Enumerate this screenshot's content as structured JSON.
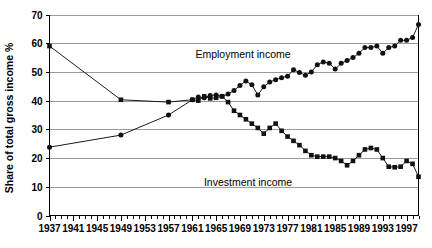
{
  "chart_data": {
    "type": "line",
    "title": "",
    "xlabel": "",
    "ylabel": "Share of total gross income %",
    "ylim": [
      0,
      70
    ],
    "ytick_step": 10,
    "yticks": [
      0,
      10,
      20,
      30,
      40,
      50,
      60,
      70
    ],
    "xlim": [
      1937,
      1999
    ],
    "xticks_labeled": [
      1937,
      1941,
      1945,
      1949,
      1953,
      1957,
      1961,
      1965,
      1969,
      1973,
      1977,
      1981,
      1985,
      1989,
      1993,
      1997
    ],
    "xtick_interval_minor": 1,
    "xtick_label_interval": 4,
    "grid": "horizontal",
    "legend_position": "inline-annotation",
    "series": [
      {
        "name": "Employment income",
        "marker": "circle",
        "annotation": "Employment income",
        "x": [
          1937,
          1949,
          1957,
          1961,
          1962,
          1963,
          1964,
          1965,
          1966,
          1967,
          1968,
          1969,
          1970,
          1971,
          1972,
          1973,
          1974,
          1975,
          1976,
          1977,
          1978,
          1979,
          1980,
          1981,
          1982,
          1983,
          1984,
          1985,
          1986,
          1987,
          1988,
          1989,
          1990,
          1991,
          1992,
          1993,
          1994,
          1995,
          1996,
          1997,
          1998,
          1999
        ],
        "values": [
          23.8,
          28.0,
          35.0,
          40.3,
          41.3,
          41.0,
          41.8,
          42.0,
          41.5,
          42.3,
          43.5,
          45.3,
          46.8,
          45.5,
          42.0,
          44.8,
          46.5,
          47.3,
          48.0,
          48.5,
          50.8,
          49.8,
          48.8,
          50.0,
          52.5,
          53.5,
          53.0,
          51.0,
          53.0,
          54.0,
          55.0,
          56.5,
          58.5,
          58.5,
          59.0,
          56.5,
          58.5,
          59.0,
          61.0,
          61.0,
          62.0,
          66.5
        ]
      },
      {
        "name": "Investment income",
        "marker": "square",
        "annotation": "Investment income",
        "x": [
          1937,
          1949,
          1957,
          1961,
          1962,
          1963,
          1964,
          1965,
          1966,
          1967,
          1968,
          1969,
          1970,
          1971,
          1972,
          1973,
          1974,
          1975,
          1976,
          1977,
          1978,
          1979,
          1980,
          1981,
          1982,
          1983,
          1984,
          1985,
          1986,
          1987,
          1988,
          1989,
          1990,
          1991,
          1992,
          1993,
          1994,
          1995,
          1996,
          1997,
          1998,
          1999
        ],
        "values": [
          59.0,
          40.3,
          39.5,
          40.3,
          40.0,
          41.5,
          40.8,
          41.0,
          41.5,
          39.5,
          36.5,
          35.0,
          33.5,
          32.0,
          30.5,
          28.5,
          30.5,
          32.0,
          29.5,
          27.5,
          26.0,
          24.5,
          22.5,
          21.0,
          20.5,
          20.5,
          20.5,
          20.0,
          19.0,
          17.5,
          19.0,
          21.0,
          23.0,
          23.5,
          23.0,
          20.0,
          17.0,
          16.8,
          17.0,
          19.0,
          18.0,
          13.5
        ]
      }
    ]
  },
  "annotations": {
    "employment_label": "Employment income",
    "investment_label": "Investment income"
  },
  "axis": {
    "y_title": "Share of total gross income %"
  },
  "colors": {
    "series_line": "#1a1a1a",
    "marker": "#111111",
    "gridline": "#9a9a9a",
    "axis": "#000000",
    "background": "#ffffff"
  }
}
